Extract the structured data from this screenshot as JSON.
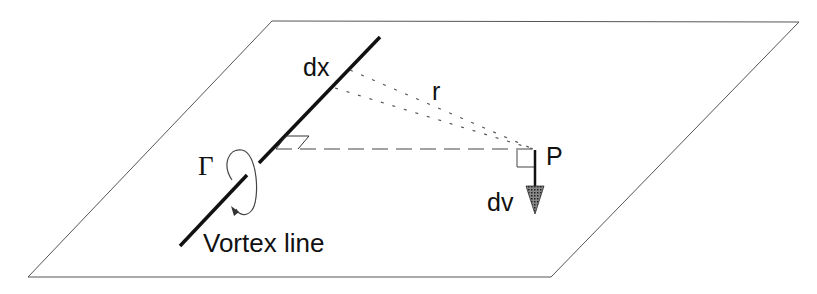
{
  "diagram": {
    "labels": {
      "segment": "dx",
      "distance": "r",
      "point": "P",
      "velocity": "dv",
      "circulation": "Γ",
      "line": "Vortex line"
    },
    "colors": {
      "stroke": "#111111",
      "plane": "#555555",
      "background": "#ffffff",
      "arrow_fill": "#555555"
    }
  }
}
